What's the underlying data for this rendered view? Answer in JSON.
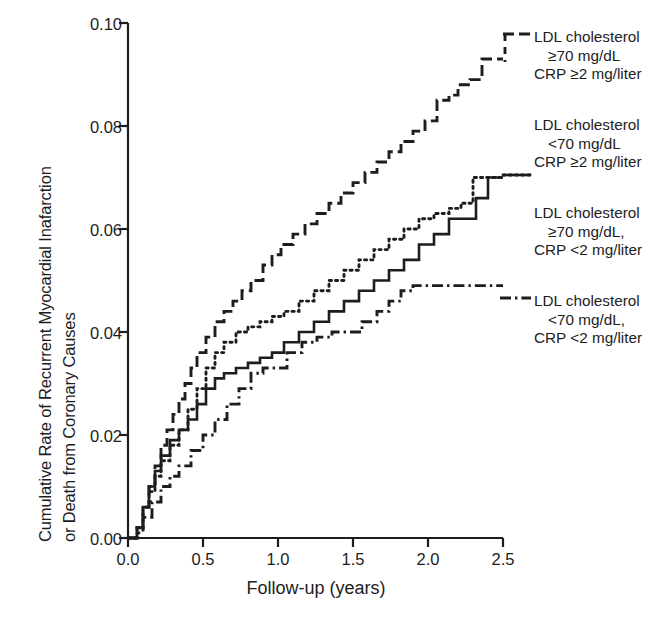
{
  "figure": {
    "axis_color": "#1d1d1d",
    "background": "#ffffff"
  },
  "axes": {
    "ylabel_line1": "Cumulative Rate of Recurrent Myocardial Inafarction",
    "ylabel_line2": "or Death from Coronary Causes",
    "xlabel": "Follow-up (years)",
    "yticks": [
      "0.10",
      "0.08",
      "0.06",
      "0.04",
      "0.02",
      "0.00"
    ],
    "xticks": [
      "0.0",
      "0.5",
      "1.0",
      "1.5",
      "2.0",
      "2.5"
    ]
  },
  "legend": {
    "entries": [
      {
        "id": "ldl-high-crp-high",
        "line_style": "dashed",
        "line1": "LDL cholesterol",
        "line2": "≥70 mg/dL",
        "line3": "CRP ≥2 mg/liter"
      },
      {
        "id": "ldl-low-crp-high",
        "line_style": "dotted",
        "line1": "LDL cholesterol",
        "line2": "<70 mg/dL",
        "line3": "CRP ≥2 mg/liter"
      },
      {
        "id": "ldl-high-crp-low",
        "line_style": "solid",
        "line1": "LDL cholesterol",
        "line2": "≥70 mg/dL,",
        "line3": "CRP <2 mg/liter"
      },
      {
        "id": "ldl-low-crp-low",
        "line_style": "dashdot",
        "line1": "LDL cholesterol",
        "line2": "<70 mg/dL,",
        "line3": "CRP <2 mg/liter"
      }
    ]
  },
  "chart_data": {
    "type": "line",
    "title": "",
    "xlabel": "Follow-up (years)",
    "ylabel": "Cumulative Rate of Recurrent Myocardial Inafarction or Death from Coronary Causes",
    "xlim": [
      0.0,
      2.5
    ],
    "ylim": [
      0.0,
      0.1
    ],
    "xticks": [
      0.0,
      0.5,
      1.0,
      1.5,
      2.0,
      2.5
    ],
    "yticks": [
      0.0,
      0.02,
      0.04,
      0.06,
      0.08,
      0.1
    ],
    "grid": false,
    "legend_position": "right",
    "step": true,
    "series": [
      {
        "name": "LDL cholesterol ≥70 mg/dL, CRP ≥2 mg/liter",
        "line_style": "dashed",
        "final_value": 0.093,
        "x": [
          0.0,
          0.06,
          0.1,
          0.14,
          0.18,
          0.22,
          0.26,
          0.3,
          0.34,
          0.38,
          0.42,
          0.46,
          0.52,
          0.58,
          0.64,
          0.7,
          0.76,
          0.82,
          0.9,
          0.96,
          1.02,
          1.1,
          1.18,
          1.26,
          1.34,
          1.42,
          1.5,
          1.58,
          1.66,
          1.74,
          1.82,
          1.9,
          1.98,
          2.06,
          2.14,
          2.2,
          2.28,
          2.36,
          2.44,
          2.5
        ],
        "y": [
          0.0,
          0.002,
          0.006,
          0.01,
          0.014,
          0.018,
          0.021,
          0.024,
          0.027,
          0.03,
          0.033,
          0.036,
          0.039,
          0.042,
          0.044,
          0.046,
          0.048,
          0.05,
          0.053,
          0.055,
          0.057,
          0.059,
          0.061,
          0.063,
          0.065,
          0.067,
          0.069,
          0.071,
          0.073,
          0.075,
          0.077,
          0.079,
          0.081,
          0.085,
          0.086,
          0.088,
          0.089,
          0.093,
          0.093,
          0.093
        ]
      },
      {
        "name": "LDL cholesterol <70 mg/dL, CRP ≥2 mg/liter",
        "line_style": "dotted",
        "final_value": 0.07,
        "x": [
          0.0,
          0.06,
          0.1,
          0.14,
          0.18,
          0.22,
          0.28,
          0.34,
          0.4,
          0.46,
          0.52,
          0.58,
          0.64,
          0.72,
          0.8,
          0.88,
          0.96,
          1.04,
          1.14,
          1.24,
          1.34,
          1.44,
          1.54,
          1.64,
          1.74,
          1.84,
          1.94,
          2.04,
          2.14,
          2.22,
          2.3,
          2.38,
          2.46,
          2.5
        ],
        "y": [
          0.0,
          0.002,
          0.006,
          0.009,
          0.012,
          0.015,
          0.018,
          0.021,
          0.025,
          0.029,
          0.033,
          0.036,
          0.038,
          0.04,
          0.041,
          0.042,
          0.043,
          0.044,
          0.046,
          0.048,
          0.05,
          0.052,
          0.054,
          0.056,
          0.058,
          0.06,
          0.062,
          0.063,
          0.064,
          0.065,
          0.07,
          0.07,
          0.07,
          0.07
        ]
      },
      {
        "name": "LDL cholesterol ≥70 mg/dL, CRP <2 mg/liter",
        "line_style": "solid",
        "final_value": 0.07,
        "x": [
          0.0,
          0.06,
          0.1,
          0.14,
          0.18,
          0.22,
          0.28,
          0.34,
          0.4,
          0.46,
          0.52,
          0.58,
          0.64,
          0.72,
          0.8,
          0.88,
          0.96,
          1.04,
          1.14,
          1.24,
          1.34,
          1.44,
          1.54,
          1.64,
          1.74,
          1.84,
          1.94,
          2.04,
          2.14,
          2.22,
          2.32,
          2.4,
          2.48,
          2.5
        ],
        "y": [
          0.0,
          0.002,
          0.006,
          0.01,
          0.013,
          0.016,
          0.019,
          0.021,
          0.023,
          0.026,
          0.029,
          0.031,
          0.032,
          0.033,
          0.034,
          0.035,
          0.036,
          0.038,
          0.04,
          0.042,
          0.044,
          0.046,
          0.048,
          0.05,
          0.052,
          0.054,
          0.057,
          0.059,
          0.062,
          0.062,
          0.066,
          0.07,
          0.07,
          0.07
        ]
      },
      {
        "name": "LDL cholesterol <70 mg/dL, CRP <2 mg/liter",
        "line_style": "dashdot",
        "final_value": 0.049,
        "x": [
          0.0,
          0.06,
          0.1,
          0.16,
          0.22,
          0.28,
          0.34,
          0.42,
          0.5,
          0.58,
          0.66,
          0.74,
          0.82,
          0.9,
          0.98,
          1.06,
          1.16,
          1.26,
          1.36,
          1.46,
          1.56,
          1.66,
          1.74,
          1.82,
          1.9,
          2.0,
          2.1,
          2.2,
          2.3,
          2.4,
          2.5
        ],
        "y": [
          0.0,
          0.001,
          0.004,
          0.007,
          0.01,
          0.012,
          0.014,
          0.017,
          0.02,
          0.023,
          0.026,
          0.029,
          0.032,
          0.033,
          0.033,
          0.036,
          0.038,
          0.039,
          0.04,
          0.04,
          0.042,
          0.044,
          0.046,
          0.048,
          0.049,
          0.049,
          0.049,
          0.049,
          0.049,
          0.049,
          0.049
        ]
      }
    ]
  }
}
